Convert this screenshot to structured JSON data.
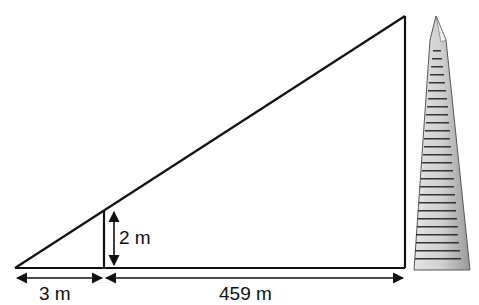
{
  "diagram": {
    "type": "similar-triangles-height-measurement",
    "labels": {
      "stick_height": "2 m",
      "short_base": "3 m",
      "long_base": "459 m"
    },
    "colors": {
      "line": "#111111",
      "building_fill": "#cfcfcf",
      "building_outline": "#555555",
      "window": "#333333"
    }
  }
}
